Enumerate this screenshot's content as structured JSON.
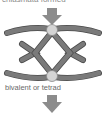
{
  "diagram": {
    "top_caption": "chiasmata formed",
    "label": "bivalent or tetrad",
    "colors": {
      "chromatid": "#7a7a7a",
      "chromatid_stroke": "#4a4a4a",
      "centromere": "#d4d4d4",
      "arrow": "#8c8c8c"
    },
    "elements": [
      {
        "type": "arrow",
        "direction": "down",
        "position": "top"
      },
      {
        "type": "chromosome-pair",
        "position": "upper"
      },
      {
        "type": "chiasma-crossing",
        "position": "middle"
      },
      {
        "type": "chromosome-pair",
        "position": "lower"
      },
      {
        "type": "arrow",
        "direction": "down",
        "position": "bottom"
      }
    ]
  }
}
